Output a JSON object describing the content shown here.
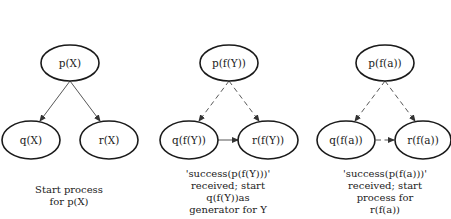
{
  "panels": [
    {
      "root": "p(X)",
      "left": "q(X)",
      "right": "r(X)",
      "edges_style": "solid",
      "sibling_edge": "none",
      "caption": [
        "Start process",
        "for p(X)"
      ]
    },
    {
      "root": "p(f(Y))",
      "left": "q(f(Y))",
      "right": "r(f(Y))",
      "edges_style": "dashed",
      "sibling_edge": "solid",
      "caption": [
        "'success(p(f(Y)))'",
        "received; start",
        "q(f(Y))as",
        "generator for Y"
      ]
    },
    {
      "root": "p(f(a))",
      "left": "q(f(a))",
      "right": "r(f(a))",
      "edges_style": "dashed",
      "sibling_edge": "dashed",
      "caption": [
        "'success(p(f(a)))'",
        "received; start",
        "process for",
        "r(f(a))"
      ]
    }
  ]
}
